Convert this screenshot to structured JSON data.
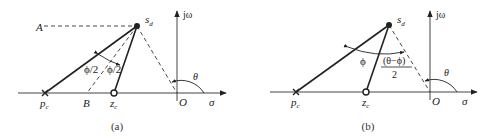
{
  "figure": {
    "panels": [
      {
        "id": "a",
        "caption": "(a)",
        "labels": {
          "sd": "s",
          "sd_sub": "d",
          "jw": "jω",
          "sigma": "σ",
          "origin": "O",
          "theta": "θ",
          "pc": "p",
          "pc_sub": "c",
          "zc": "z",
          "zc_sub": "c",
          "A": "A",
          "B": "B",
          "half_phi_left": "ϕ/2",
          "half_phi_right": "ϕ/2"
        }
      },
      {
        "id": "b",
        "caption": "(b)",
        "labels": {
          "sd": "s",
          "sd_sub": "d",
          "jw": "jω",
          "sigma": "σ",
          "origin": "O",
          "theta": "θ",
          "pc": "p",
          "pc_sub": "c",
          "zc": "z",
          "zc_sub": "c",
          "phi": "ϕ",
          "frac_num": "(θ−ϕ)",
          "frac_den": "2"
        }
      }
    ],
    "colors": {
      "line": "#222222",
      "axis": "#444444"
    }
  }
}
